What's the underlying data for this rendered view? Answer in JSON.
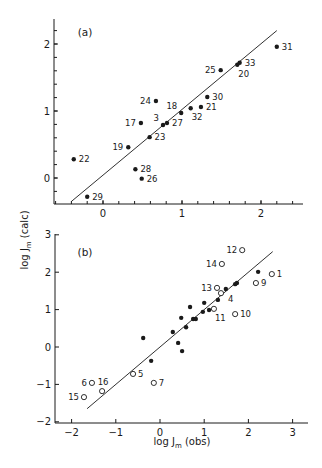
{
  "figure": {
    "ylabel": "log J",
    "ylabel_sub": "m",
    "ylabel_suffix": " (calc)",
    "xlabel": "log J",
    "xlabel_sub": "m",
    "xlabel_suffix": " (obs)"
  },
  "chart_data": [
    {
      "panel": "(a)",
      "type": "scatter",
      "title": "",
      "xlabel": "log Jm (obs)",
      "ylabel": "log Jm (calc)",
      "xlim": [
        -0.62,
        2.55
      ],
      "ylim": [
        -0.35,
        2.4
      ],
      "xticks": [
        0,
        1,
        2
      ],
      "yticks": [
        0,
        1,
        2
      ],
      "x_minor_step": 0.2,
      "y_minor_step": 0.2,
      "grid": false,
      "fit_line": [
        [
          -0.4,
          -0.35
        ],
        [
          2.2,
          2.2
        ]
      ],
      "series": [
        {
          "name": "compounds",
          "marker": "filled",
          "points": [
            {
              "label": "22",
              "x": -0.37,
              "y": 0.28,
              "label_pos": "right"
            },
            {
              "label": "29",
              "x": -0.2,
              "y": -0.28,
              "label_pos": "right"
            },
            {
              "label": "28",
              "x": 0.41,
              "y": 0.13,
              "label_pos": "right"
            },
            {
              "label": "26",
              "x": 0.49,
              "y": -0.01,
              "label_pos": "right"
            },
            {
              "label": "19",
              "x": 0.32,
              "y": 0.46,
              "label_pos": "left"
            },
            {
              "label": "23",
              "x": 0.59,
              "y": 0.61,
              "label_pos": "right"
            },
            {
              "label": "17",
              "x": 0.48,
              "y": 0.82,
              "label_pos": "left"
            },
            {
              "label": "3",
              "x": 0.76,
              "y": 0.79,
              "label_pos": "upleft"
            },
            {
              "label": "27",
              "x": 0.81,
              "y": 0.82,
              "label_pos": "right"
            },
            {
              "label": "24",
              "x": 0.67,
              "y": 1.15,
              "label_pos": "left"
            },
            {
              "label": "18",
              "x": 0.99,
              "y": 0.97,
              "label_pos": "upleft"
            },
            {
              "label": "32",
              "x": 1.11,
              "y": 1.04,
              "label_pos": "below"
            },
            {
              "label": "21",
              "x": 1.24,
              "y": 1.06,
              "label_pos": "right"
            },
            {
              "label": "30",
              "x": 1.32,
              "y": 1.21,
              "label_pos": "right"
            },
            {
              "label": "25",
              "x": 1.49,
              "y": 1.61,
              "label_pos": "left"
            },
            {
              "label": "20",
              "x": 1.7,
              "y": 1.69,
              "label_pos": "below"
            },
            {
              "label": "33",
              "x": 1.73,
              "y": 1.72,
              "label_pos": "right"
            },
            {
              "label": "31",
              "x": 2.2,
              "y": 1.96,
              "label_pos": "right"
            }
          ]
        }
      ]
    },
    {
      "panel": "(b)",
      "type": "scatter",
      "title": "",
      "xlabel": "log Jm (obs)",
      "ylabel": "log Jm (calc)",
      "xlim": [
        -2.35,
        3.3
      ],
      "ylim": [
        -2.0,
        3.0
      ],
      "xticks": [
        -2,
        -1,
        0,
        1,
        2,
        3
      ],
      "yticks": [
        -2,
        -1,
        0,
        1,
        2,
        3
      ],
      "grid": false,
      "fit_line": [
        [
          -1.65,
          -1.65
        ],
        [
          2.55,
          2.55
        ]
      ],
      "series": [
        {
          "name": "filled",
          "marker": "filled",
          "points": [
            {
              "x": -0.38,
              "y": 0.24
            },
            {
              "x": -0.2,
              "y": -0.37
            },
            {
              "x": 0.29,
              "y": 0.4
            },
            {
              "x": 0.41,
              "y": 0.11
            },
            {
              "x": 0.5,
              "y": -0.11
            },
            {
              "x": 0.48,
              "y": 0.78
            },
            {
              "x": 0.59,
              "y": 0.53
            },
            {
              "x": 0.68,
              "y": 1.07
            },
            {
              "x": 0.75,
              "y": 0.75
            },
            {
              "x": 0.81,
              "y": 0.75
            },
            {
              "x": 0.97,
              "y": 0.94
            },
            {
              "x": 1.0,
              "y": 1.18
            },
            {
              "x": 1.11,
              "y": 0.99
            },
            {
              "x": 1.31,
              "y": 1.26
            },
            {
              "x": 1.49,
              "y": 1.55
            },
            {
              "x": 1.7,
              "y": 1.68
            },
            {
              "x": 1.74,
              "y": 1.71
            },
            {
              "x": 2.22,
              "y": 2.01
            }
          ]
        },
        {
          "name": "open",
          "marker": "open",
          "points": [
            {
              "label": "1",
              "x": 2.53,
              "y": 1.95,
              "label_pos": "right"
            },
            {
              "label": "4",
              "x": 1.38,
              "y": 1.44,
              "label_pos": "belowright"
            },
            {
              "label": "5",
              "x": -0.61,
              "y": -0.72,
              "label_pos": "right"
            },
            {
              "label": "6",
              "x": -1.54,
              "y": -0.96,
              "label_pos": "left"
            },
            {
              "label": "7",
              "x": -0.14,
              "y": -0.96,
              "label_pos": "right"
            },
            {
              "label": "9",
              "x": 2.17,
              "y": 1.71,
              "label_pos": "right"
            },
            {
              "label": "10",
              "x": 1.7,
              "y": 0.88,
              "label_pos": "right"
            },
            {
              "label": "11",
              "x": 1.22,
              "y": 1.02,
              "label_pos": "below"
            },
            {
              "label": "12",
              "x": 1.86,
              "y": 2.59,
              "label_pos": "left"
            },
            {
              "label": "13",
              "x": 1.29,
              "y": 1.58,
              "label_pos": "left"
            },
            {
              "label": "14",
              "x": 1.4,
              "y": 2.22,
              "label_pos": "left"
            },
            {
              "label": "15",
              "x": -1.72,
              "y": -1.34,
              "label_pos": "left"
            },
            {
              "label": "16",
              "x": -1.31,
              "y": -1.18,
              "label_pos": "above"
            }
          ]
        }
      ]
    }
  ]
}
